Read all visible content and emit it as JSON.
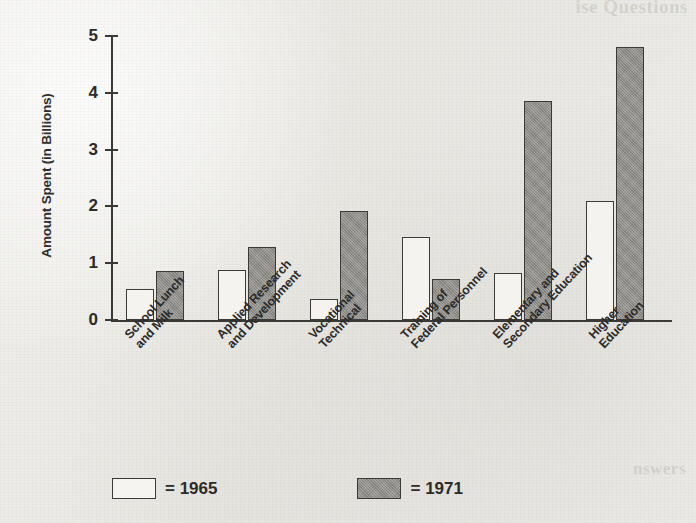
{
  "background": {
    "paper_color": "#edeCE8",
    "ink_color": "#2d2c2a",
    "showthrough_topright": "ise Questions",
    "showthrough_bottomright": "nswers",
    "showthrough_title": ""
  },
  "legend": {
    "items": [
      {
        "key": "y1965",
        "label": "= 1965",
        "fill": "#f5f4f0",
        "swatch_name": "legend-swatch-1965"
      },
      {
        "key": "y1971",
        "label": "= 1971",
        "fill": "#8e8d89",
        "swatch_name": "legend-swatch-1971"
      }
    ]
  },
  "chart_data": {
    "type": "bar",
    "title": "",
    "xlabel": "",
    "ylabel": "Amount Spent (in Billions)",
    "ylim": [
      0,
      5
    ],
    "yticks": [
      0,
      1,
      2,
      3,
      4,
      5
    ],
    "ytick_labels": [
      "0",
      "1",
      "2",
      "3",
      "4",
      "5"
    ],
    "grid": false,
    "legend_position": "bottom-left",
    "categories": [
      "School Lunch and Milk",
      "Applied Research and Development",
      "Vocational Technical",
      "Training of Federal Personnel",
      "Elementary and Secondary Education",
      "Higher Education"
    ],
    "category_lines": [
      [
        "School Lunch",
        "and Milk"
      ],
      [
        "Applied Research",
        "and Development"
      ],
      [
        "Vocational",
        "Technical"
      ],
      [
        "Training of",
        "Federal Personnel"
      ],
      [
        "Elementary and",
        "Secondary Education"
      ],
      [
        "Higher",
        "Education"
      ]
    ],
    "series": [
      {
        "name": "1965",
        "key": "y1965",
        "fill": "#f4f3ef",
        "values": [
          0.55,
          0.88,
          0.37,
          1.46,
          0.82,
          2.1
        ]
      },
      {
        "name": "1971",
        "key": "y1971",
        "fill": "#8e8d89",
        "values": [
          0.87,
          1.28,
          1.92,
          0.73,
          3.85,
          4.8
        ]
      }
    ]
  },
  "geometry": {
    "plot_left": 113,
    "plot_baseline_y": 320,
    "plot_top_y": 36,
    "unit_px": 56.8,
    "bar_width": 28,
    "group_starts": [
      126,
      218,
      310,
      402,
      494,
      586
    ],
    "label_anchors": [
      {
        "x": 122,
        "y": 332
      },
      {
        "x": 214,
        "y": 332
      },
      {
        "x": 306,
        "y": 332
      },
      {
        "x": 398,
        "y": 332
      },
      {
        "x": 490,
        "y": 332
      },
      {
        "x": 586,
        "y": 332
      }
    ],
    "ytick_y": [
      320,
      263,
      206,
      149,
      92,
      36
    ]
  }
}
